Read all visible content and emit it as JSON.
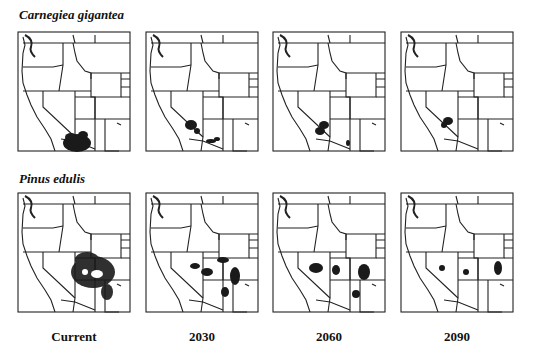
{
  "figure": {
    "rows": [
      {
        "species": "Carnegiea gigantea"
      },
      {
        "species": "Pinus edulis"
      }
    ],
    "columns": [
      "Current",
      "2030",
      "2060",
      "2090"
    ],
    "map_region": "western-united-states-outline",
    "range_color": "#1a1a1a"
  }
}
